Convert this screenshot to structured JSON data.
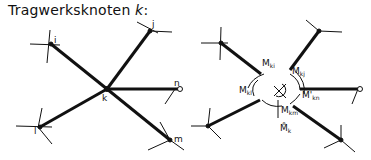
{
  "title": {
    "text": "Tragwerksknoten ",
    "var": "k",
    "suffix": ":"
  },
  "left_diagram": {
    "center_label": "k",
    "node_labels": {
      "i": "i",
      "j": "j",
      "n": "n",
      "l": "l",
      "m": "m"
    }
  },
  "right_diagram": {
    "moments": {
      "ki": {
        "main": "M",
        "sub": "ki"
      },
      "kj": {
        "main": "M",
        "sub": "kj"
      },
      "kl": {
        "main": "M",
        "sub": "kl"
      },
      "kn": {
        "main": "M'",
        "sub": "kn"
      },
      "km": {
        "main": "M",
        "sub": "km"
      },
      "k": {
        "main": "M̊",
        "sub": "k"
      }
    }
  }
}
